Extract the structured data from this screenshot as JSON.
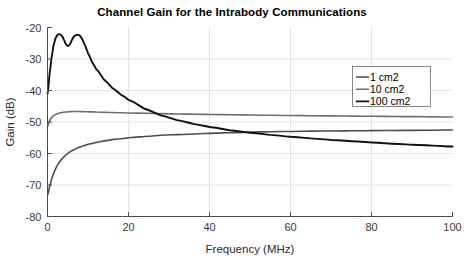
{
  "chart_data": {
    "type": "line",
    "title": "Channel Gain for the Intrabody Communications",
    "xlabel": "Frequency (MHz)",
    "ylabel": "Gain (dB)",
    "xlim": [
      0,
      100
    ],
    "ylim": [
      -80,
      -20
    ],
    "xticks": [
      0,
      20,
      40,
      60,
      80,
      100
    ],
    "yticks": [
      -20,
      -30,
      -40,
      -50,
      -60,
      -70,
      -80
    ],
    "xtick_labels": [
      "0",
      "20",
      "40",
      "60",
      "80",
      "100"
    ],
    "ytick_labels": [
      "-20",
      "-30",
      "-40",
      "-50",
      "-60",
      "-70",
      "-80"
    ],
    "grid": true,
    "legend_position": "right-upper",
    "x": [
      0,
      0.5,
      1,
      1.5,
      2,
      2.5,
      3,
      3.5,
      4,
      4.5,
      5,
      5.5,
      6,
      6.5,
      7,
      7.5,
      8,
      8.5,
      9,
      10,
      11,
      12,
      14,
      16,
      18,
      20,
      24,
      28,
      32,
      36,
      40,
      45,
      50,
      55,
      60,
      65,
      70,
      75,
      80,
      85,
      90,
      95,
      100
    ],
    "series": [
      {
        "name": "1 cm2",
        "color": "#4d4d4d",
        "width": 1.6,
        "values": [
          -73.2,
          -70.6,
          -68.2,
          -66.3,
          -64.8,
          -63.6,
          -62.6,
          -61.8,
          -61.1,
          -60.5,
          -60.0,
          -59.5,
          -59.1,
          -58.8,
          -58.5,
          -58.2,
          -57.9,
          -57.7,
          -57.5,
          -57.1,
          -56.8,
          -56.5,
          -56.0,
          -55.6,
          -55.3,
          -55.0,
          -54.6,
          -54.2,
          -54.0,
          -53.8,
          -53.6,
          -53.4,
          -53.2,
          -53.1,
          -53.0,
          -52.9,
          -52.85,
          -52.8,
          -52.75,
          -52.7,
          -52.65,
          -52.6,
          -52.55
        ]
      },
      {
        "name": "10 cm2",
        "color": "#6e6e6e",
        "width": 1.6,
        "values": [
          -51.4,
          -49.6,
          -48.6,
          -48.0,
          -47.6,
          -47.35,
          -47.15,
          -47.0,
          -46.9,
          -46.82,
          -46.76,
          -46.72,
          -46.7,
          -46.68,
          -46.68,
          -46.68,
          -46.68,
          -46.7,
          -46.72,
          -46.76,
          -46.8,
          -46.84,
          -46.92,
          -47.0,
          -47.06,
          -47.12,
          -47.24,
          -47.34,
          -47.44,
          -47.52,
          -47.6,
          -47.7,
          -47.78,
          -47.86,
          -47.94,
          -48.0,
          -48.06,
          -48.12,
          -48.18,
          -48.24,
          -48.3,
          -48.36,
          -48.42
        ]
      },
      {
        "name": "100 cm2",
        "color": "#111111",
        "width": 1.9,
        "values": [
          -41.0,
          -34.8,
          -29.6,
          -25.6,
          -23.4,
          -22.3,
          -22.1,
          -22.6,
          -23.8,
          -25.2,
          -25.9,
          -25.3,
          -24.0,
          -22.9,
          -22.4,
          -22.3,
          -22.6,
          -23.6,
          -25.0,
          -28.2,
          -31.0,
          -33.2,
          -36.6,
          -39.2,
          -41.2,
          -43.0,
          -45.8,
          -47.9,
          -49.4,
          -50.6,
          -51.6,
          -52.6,
          -53.4,
          -54.1,
          -54.7,
          -55.2,
          -55.7,
          -56.1,
          -56.5,
          -56.9,
          -57.2,
          -57.5,
          -57.8
        ]
      }
    ]
  },
  "legend": {
    "entries": [
      {
        "label": "1 cm2"
      },
      {
        "label": "10 cm2"
      },
      {
        "label": "100 cm2"
      }
    ]
  }
}
